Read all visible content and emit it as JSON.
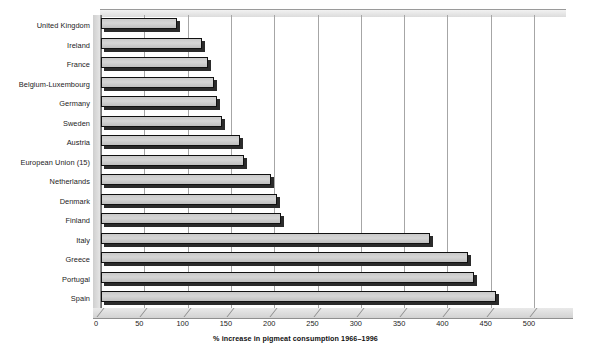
{
  "chart_data": {
    "type": "bar",
    "orientation": "horizontal",
    "title": "",
    "xlabel": "% increase in pigmeat consumption 1966–1996",
    "ylabel": "",
    "xlim": [
      0,
      500
    ],
    "xticks": [
      0,
      50,
      100,
      150,
      200,
      250,
      300,
      350,
      400,
      450,
      500
    ],
    "grid": true,
    "legend": "none",
    "categories": [
      "United Kingdom",
      "Ireland",
      "France",
      "Belgium-Luxembourg",
      "Germany",
      "Sweden",
      "Austria",
      "European Union (15)",
      "Netherlands",
      "Denmark",
      "Finland",
      "Italy",
      "Greece",
      "Portugal",
      "Spain"
    ],
    "values": [
      88,
      117,
      123,
      130,
      134,
      140,
      161,
      165,
      196,
      203,
      208,
      380,
      424,
      431,
      456
    ]
  },
  "axis": {
    "tick_labels": [
      "0",
      "50",
      "100",
      "150",
      "200",
      "250",
      "300",
      "350",
      "400",
      "450",
      "500"
    ],
    "title": "% increase in pigmeat consumption 1966–1996"
  },
  "style": {
    "bar_face": "#cfcfcf",
    "bar_edge": "#111111",
    "bar_shadow": "#2b2b2b",
    "gridline": "#a6a6a6",
    "background": "#ffffff",
    "text": "#1b1b1b"
  }
}
